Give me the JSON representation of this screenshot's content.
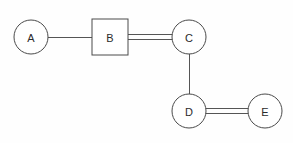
{
  "diagram": {
    "background_color": "#fefefe",
    "stroke_color": "#4a4a4a",
    "edge_color": "#555555",
    "label_color": "#2b2b2b",
    "canvas": {
      "width": 293,
      "height": 143
    },
    "nodes": [
      {
        "id": "A",
        "label": "A",
        "shape": "circle",
        "cx": 31,
        "cy": 37,
        "r": 17
      },
      {
        "id": "B",
        "label": "B",
        "shape": "square",
        "cx": 110,
        "cy": 37,
        "x": 92,
        "y": 19,
        "width": 36,
        "height": 36
      },
      {
        "id": "C",
        "label": "C",
        "shape": "circle",
        "cx": 189,
        "cy": 37,
        "r": 17
      },
      {
        "id": "D",
        "label": "D",
        "shape": "circle",
        "cx": 189,
        "cy": 111,
        "r": 17
      },
      {
        "id": "E",
        "label": "E",
        "shape": "circle",
        "cx": 265,
        "cy": 111,
        "r": 17
      }
    ],
    "edges": [
      {
        "id": "A-B",
        "from": "A",
        "to": "B",
        "style": "single",
        "orientation": "horizontal",
        "x1": 48,
        "y1": 37,
        "x2": 92,
        "y2": 37
      },
      {
        "id": "B-C",
        "from": "B",
        "to": "C",
        "style": "double",
        "orientation": "horizontal",
        "x1": 128,
        "y1": 37,
        "x2": 174,
        "y2": 37,
        "offset": 2.5
      },
      {
        "id": "C-D",
        "from": "C",
        "to": "D",
        "style": "single",
        "orientation": "vertical",
        "x1": 189,
        "y1": 54,
        "x2": 189,
        "y2": 94
      },
      {
        "id": "D-E",
        "from": "D",
        "to": "E",
        "style": "double",
        "orientation": "horizontal",
        "x1": 206,
        "y1": 111,
        "x2": 249,
        "y2": 111,
        "offset": 2.5
      }
    ]
  }
}
